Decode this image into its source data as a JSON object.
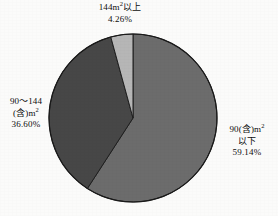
{
  "chart_data": {
    "type": "pie",
    "title": "",
    "subtitle": "",
    "xlabel": "",
    "ylabel": "",
    "grid": false,
    "legend_position": "callout-labels",
    "start_angle_deg": 0,
    "direction": "clockwise",
    "center": {
      "x": 133,
      "y": 118
    },
    "radius": 84,
    "categories": [
      "90(含)m² 以下",
      "90～144 (含)m²",
      "144m²以上"
    ],
    "values": [
      59.14,
      36.6,
      4.26
    ],
    "value_unit": "%",
    "colors": [
      "#6c6c6c",
      "#474747",
      "#b6b6b6"
    ],
    "slices": [
      {
        "key": "under-90",
        "label_lines": [
          "90(含)m",
          "以下"
        ],
        "superscript": "2",
        "percent_text": "59.14%",
        "value": 59.14,
        "color": "#6c6c6c",
        "start_deg": 0,
        "end_deg": 212.9
      },
      {
        "key": "90-to-144",
        "label_lines": [
          "90～144",
          "(含)m"
        ],
        "superscript": "2",
        "percent_text": "36.60%",
        "value": 36.6,
        "color": "#474747",
        "start_deg": 212.9,
        "end_deg": 344.66
      },
      {
        "key": "over-144",
        "label_lines": [
          "144m"
        ],
        "superscript": "2",
        "label_suffix": "以上",
        "percent_text": "4.26%",
        "value": 4.26,
        "color": "#b6b6b6",
        "start_deg": 344.66,
        "end_deg": 360
      }
    ]
  },
  "labels": {
    "top": {
      "line1_main": "144m",
      "line1_sup": "2",
      "line1_tail": "以上",
      "line2": "4.26%"
    },
    "left": {
      "line1": "90～144",
      "line2_main": "(含)m",
      "line2_sup": "2",
      "line3": "36.60%"
    },
    "right": {
      "line1_main": "90(含)m",
      "line1_sup": "2",
      "line2": "以下",
      "line3": "59.14%"
    }
  },
  "style": {
    "background": "#fbfbfa",
    "outline": "#1a1a1a",
    "text_color": "#0d0d0d"
  }
}
